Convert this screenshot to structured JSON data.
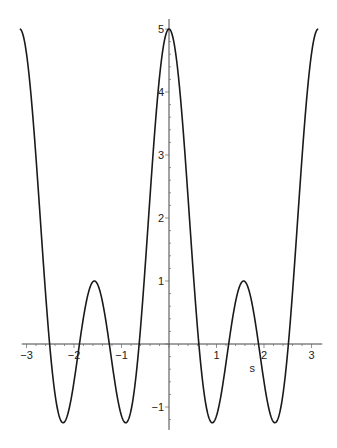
{
  "chart_data": {
    "type": "line",
    "title": "",
    "xlabel": "s",
    "ylabel": "",
    "xlim": [
      -3.14159,
      3.14159
    ],
    "ylim": [
      -1.3,
      5
    ],
    "grid": false,
    "legend": null,
    "function": "1 + 2cos(2s) + 2cos(4s)",
    "x_ticks": [
      -3,
      -2,
      -1,
      1,
      2,
      3
    ],
    "x_tick_labels": [
      "−3",
      "−2",
      "−1",
      "1",
      "2",
      "3"
    ],
    "y_ticks": [
      -1,
      1,
      2,
      3,
      4,
      5
    ],
    "y_tick_labels": [
      "−1",
      "1",
      "2",
      "3",
      "4",
      "5"
    ],
    "series": [
      {
        "name": "f(s)",
        "color": "#1a1a1a",
        "x": [
          -3.1416,
          -2.7489,
          -2.3562,
          -2.0,
          -1.5708,
          -1.2,
          -0.7854,
          -0.4,
          0,
          0.4,
          0.7854,
          1.2,
          1.5708,
          2.0,
          2.3562,
          2.7489,
          3.1416
        ],
        "values": [
          5.0,
          0.0,
          -1.0,
          0.0,
          1.0,
          0.0,
          -1.0,
          2.5,
          5.0,
          2.5,
          -1.0,
          0.0,
          1.0,
          0.0,
          -1.0,
          0.0,
          5.0
        ]
      }
    ],
    "annotations": []
  },
  "layout": {
    "x_origin_px": 169,
    "y_origin_px": 344,
    "px_per_x": 47.5,
    "px_per_y": 63
  }
}
